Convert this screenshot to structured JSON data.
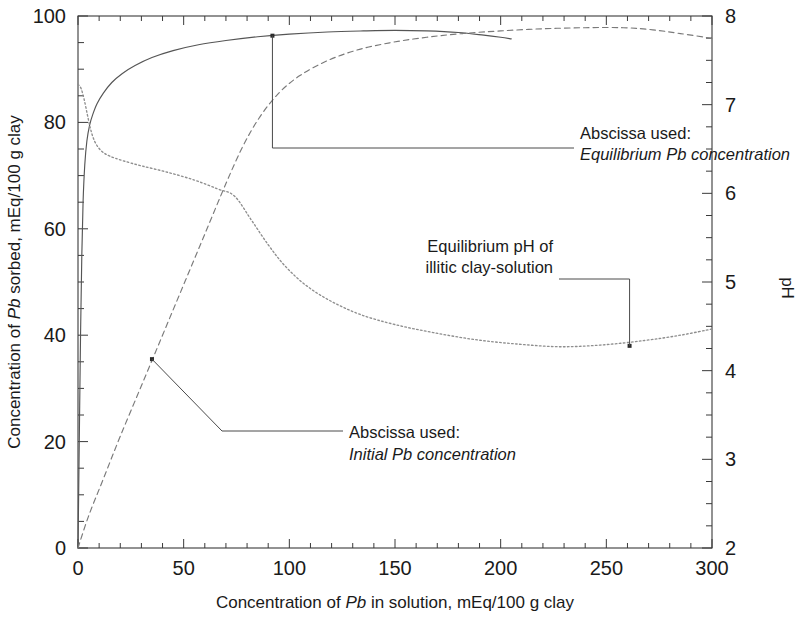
{
  "chart_data": {
    "type": "line",
    "title": "",
    "xlabel": "Concentration of Pb in solution, mEq/100 g clay",
    "ylabel_left": "Concentration of Pb sorbed, mEq/100 g clay",
    "ylabel_right": "pH",
    "xlim": [
      0,
      300
    ],
    "ylim_left": [
      0,
      100
    ],
    "ylim_right": [
      2,
      8
    ],
    "xticks": [
      0,
      50,
      100,
      150,
      200,
      250,
      300
    ],
    "yticks_left": [
      0,
      20,
      40,
      60,
      80,
      100
    ],
    "yticks_right": [
      2,
      3,
      4,
      5,
      6,
      7,
      8
    ],
    "minor_tick_interval_x": 10,
    "minor_tick_interval_y_left": 5,
    "minor_tick_interval_y_right": 0.25,
    "grid": false,
    "legend_position": "none",
    "series": [
      {
        "name": "Pb sorbed vs equilibrium Pb concentration",
        "style": "solid",
        "axis": "left",
        "points": [
          [
            0.0,
            0.0
          ],
          [
            0.6,
            20.0
          ],
          [
            1.2,
            40.0
          ],
          [
            1.8,
            55.0
          ],
          [
            2.4,
            65.0
          ],
          [
            3.2,
            72.0
          ],
          [
            4.2,
            76.5
          ],
          [
            5.5,
            79.5
          ],
          [
            7.0,
            81.5
          ],
          [
            9.0,
            83.5
          ],
          [
            12.0,
            85.5
          ],
          [
            16.0,
            87.5
          ],
          [
            21.0,
            89.2
          ],
          [
            27.0,
            90.7
          ],
          [
            35.0,
            92.2
          ],
          [
            45.0,
            93.5
          ],
          [
            57.0,
            94.6
          ],
          [
            70.0,
            95.4
          ],
          [
            85.0,
            96.1
          ],
          [
            100.0,
            96.6
          ],
          [
            118.0,
            97.0
          ],
          [
            135.0,
            97.2
          ],
          [
            150.0,
            97.3
          ],
          [
            165.0,
            97.2
          ],
          [
            180.0,
            96.9
          ],
          [
            192.0,
            96.4
          ],
          [
            200.0,
            96.0
          ],
          [
            205.0,
            95.7
          ]
        ]
      },
      {
        "name": "Pb sorbed vs initial Pb concentration",
        "style": "dashed",
        "axis": "left",
        "points": [
          [
            0.0,
            0.0
          ],
          [
            5.0,
            6.0
          ],
          [
            12.0,
            13.0
          ],
          [
            20.0,
            21.0
          ],
          [
            30.0,
            30.5
          ],
          [
            40.0,
            40.0
          ],
          [
            50.0,
            49.5
          ],
          [
            60.0,
            59.0
          ],
          [
            70.0,
            68.5
          ],
          [
            78.0,
            75.5
          ],
          [
            86.0,
            81.0
          ],
          [
            95.0,
            85.5
          ],
          [
            105.0,
            88.8
          ],
          [
            118.0,
            91.6
          ],
          [
            132.0,
            93.6
          ],
          [
            148.0,
            95.0
          ],
          [
            165.0,
            96.0
          ],
          [
            182.0,
            96.7
          ],
          [
            200.0,
            97.2
          ],
          [
            220.0,
            97.6
          ],
          [
            240.0,
            97.8
          ],
          [
            258.0,
            97.8
          ],
          [
            272.0,
            97.4
          ],
          [
            285.0,
            96.7
          ],
          [
            300.0,
            95.8
          ]
        ]
      },
      {
        "name": "Equilibrium pH of illitic clay-solution",
        "style": "dotted",
        "axis": "right",
        "points": [
          [
            0.0,
            7.23
          ],
          [
            1.5,
            7.18
          ],
          [
            3.0,
            7.05
          ],
          [
            4.5,
            6.88
          ],
          [
            6.0,
            6.72
          ],
          [
            8.0,
            6.58
          ],
          [
            11.0,
            6.48
          ],
          [
            15.0,
            6.42
          ],
          [
            21.0,
            6.37
          ],
          [
            30.0,
            6.31
          ],
          [
            42.0,
            6.24
          ],
          [
            55.0,
            6.15
          ],
          [
            66.0,
            6.05
          ],
          [
            74.0,
            5.97
          ],
          [
            82.0,
            5.7
          ],
          [
            90.0,
            5.42
          ],
          [
            98.0,
            5.18
          ],
          [
            108.0,
            4.96
          ],
          [
            120.0,
            4.78
          ],
          [
            134.0,
            4.63
          ],
          [
            150.0,
            4.52
          ],
          [
            168.0,
            4.43
          ],
          [
            188.0,
            4.35
          ],
          [
            208.0,
            4.3
          ],
          [
            228.0,
            4.27
          ],
          [
            248.0,
            4.29
          ],
          [
            268.0,
            4.34
          ],
          [
            285.0,
            4.4
          ],
          [
            300.0,
            4.47
          ]
        ]
      }
    ],
    "annotations": [
      {
        "id": "abscissa-equilibrium",
        "line1": "Abscissa used:",
        "line2": "Equilibrium Pb concentration",
        "line2_style": "italic",
        "target_x": 92,
        "target_y_left": 96.3
      },
      {
        "id": "equilibrium-ph",
        "line1": "Equilibrium pH of",
        "line2": "illitic clay-solution",
        "line2_style": "normal",
        "target_x": 261,
        "target_y_right": 4.28
      },
      {
        "id": "abscissa-initial",
        "line1": "Abscissa used:",
        "line2": "Initial Pb concentration",
        "line2_style": "italic",
        "target_x": 35,
        "target_y_left": 35.5
      }
    ]
  },
  "axes": {
    "x_tick_labels": [
      "0",
      "50",
      "100",
      "150",
      "200",
      "250",
      "300"
    ],
    "y_left_tick_labels": [
      "0",
      "20",
      "40",
      "60",
      "80",
      "100"
    ],
    "y_right_tick_labels": [
      "2",
      "3",
      "4",
      "5",
      "6",
      "7",
      "8"
    ],
    "x_title_parts": {
      "pre": "Concentration of ",
      "italic": "Pb",
      "post": " in solution, mEq/100 g  clay"
    },
    "y_left_title_parts": {
      "pre": "Concentration of ",
      "italic": "Pb",
      "post": " sorbed,  mEq/100 g clay"
    },
    "y_right_title": "pH"
  },
  "colors": {
    "axis": "#3a3a3a",
    "solid_curve": "#555555",
    "dashed_curve": "#7a7a7a",
    "dotted_curve": "#8e8e8e",
    "text": "#1a1a1a",
    "background": "#ffffff"
  }
}
